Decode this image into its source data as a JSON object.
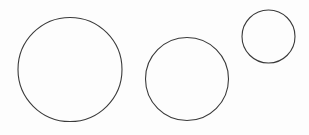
{
  "diagram": {
    "background": "#fdfdfd",
    "stroke_color": "#3a3a3a",
    "stroke_width": 1.1,
    "circles": [
      {
        "id": "large",
        "cx": 70,
        "cy": 69.5,
        "r": 52
      },
      {
        "id": "medium",
        "cx": 187,
        "cy": 79,
        "r": 41.5
      },
      {
        "id": "small",
        "cx": 268.5,
        "cy": 36.5,
        "r": 26.5
      }
    ]
  }
}
